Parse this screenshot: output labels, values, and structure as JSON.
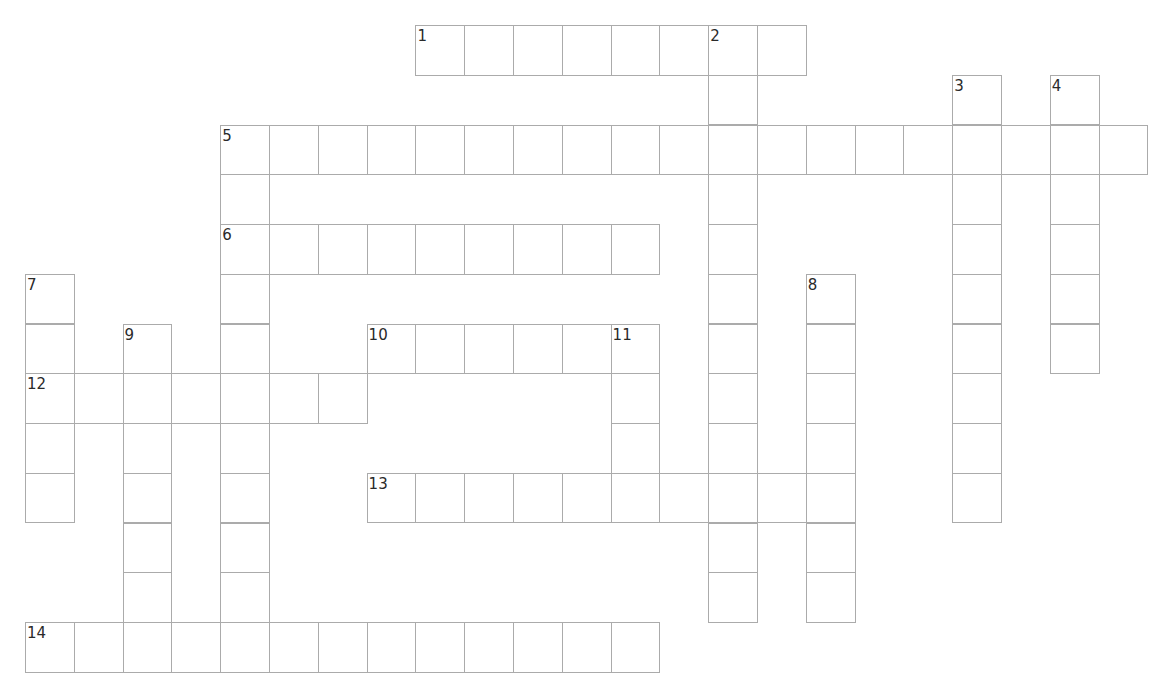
{
  "puzzle": {
    "type": "crossword",
    "grid": {
      "origin_x": 25,
      "origin_y": 25,
      "cell_w": 48.8,
      "cell_h": 49.75,
      "cols": 23,
      "rows": 13
    },
    "colors": {
      "background": "#ffffff",
      "cell_border": "#ababab",
      "number_text": "#2a2a2a"
    },
    "words": [
      {
        "number": "1",
        "direction": "across",
        "row": 0,
        "col": 8,
        "length": 8
      },
      {
        "number": "2",
        "direction": "down",
        "row": 0,
        "col": 14,
        "length": 12
      },
      {
        "number": "3",
        "direction": "down",
        "row": 1,
        "col": 19,
        "length": 9
      },
      {
        "number": "4",
        "direction": "down",
        "row": 1,
        "col": 21,
        "length": 6
      },
      {
        "number": "5",
        "direction": "across",
        "row": 2,
        "col": 4,
        "length": 19
      },
      {
        "number": "5",
        "direction": "down",
        "row": 2,
        "col": 4,
        "length": 10
      },
      {
        "number": "6",
        "direction": "across",
        "row": 4,
        "col": 4,
        "length": 9
      },
      {
        "number": "7",
        "direction": "down",
        "row": 5,
        "col": 0,
        "length": 5
      },
      {
        "number": "8",
        "direction": "down",
        "row": 5,
        "col": 16,
        "length": 7
      },
      {
        "number": "9",
        "direction": "down",
        "row": 6,
        "col": 2,
        "length": 7
      },
      {
        "number": "10",
        "direction": "across",
        "row": 6,
        "col": 7,
        "length": 6
      },
      {
        "number": "11",
        "direction": "down",
        "row": 6,
        "col": 12,
        "length": 4
      },
      {
        "number": "12",
        "direction": "across",
        "row": 7,
        "col": 0,
        "length": 7
      },
      {
        "number": "13",
        "direction": "across",
        "row": 9,
        "col": 7,
        "length": 10
      },
      {
        "number": "14",
        "direction": "across",
        "row": 12,
        "col": 0,
        "length": 13
      }
    ]
  }
}
